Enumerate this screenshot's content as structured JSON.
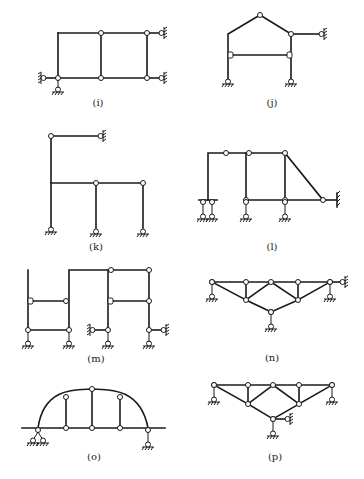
{
  "figure": {
    "panels": [
      {
        "id": "i",
        "label": "(i)"
      },
      {
        "id": "j",
        "label": "(j)"
      },
      {
        "id": "k",
        "label": "(k)"
      },
      {
        "id": "l",
        "label": "(l)"
      },
      {
        "id": "m",
        "label": "(m)"
      },
      {
        "id": "n",
        "label": "(n)"
      },
      {
        "id": "o",
        "label": "(o)"
      },
      {
        "id": "p",
        "label": "(p)"
      }
    ]
  }
}
